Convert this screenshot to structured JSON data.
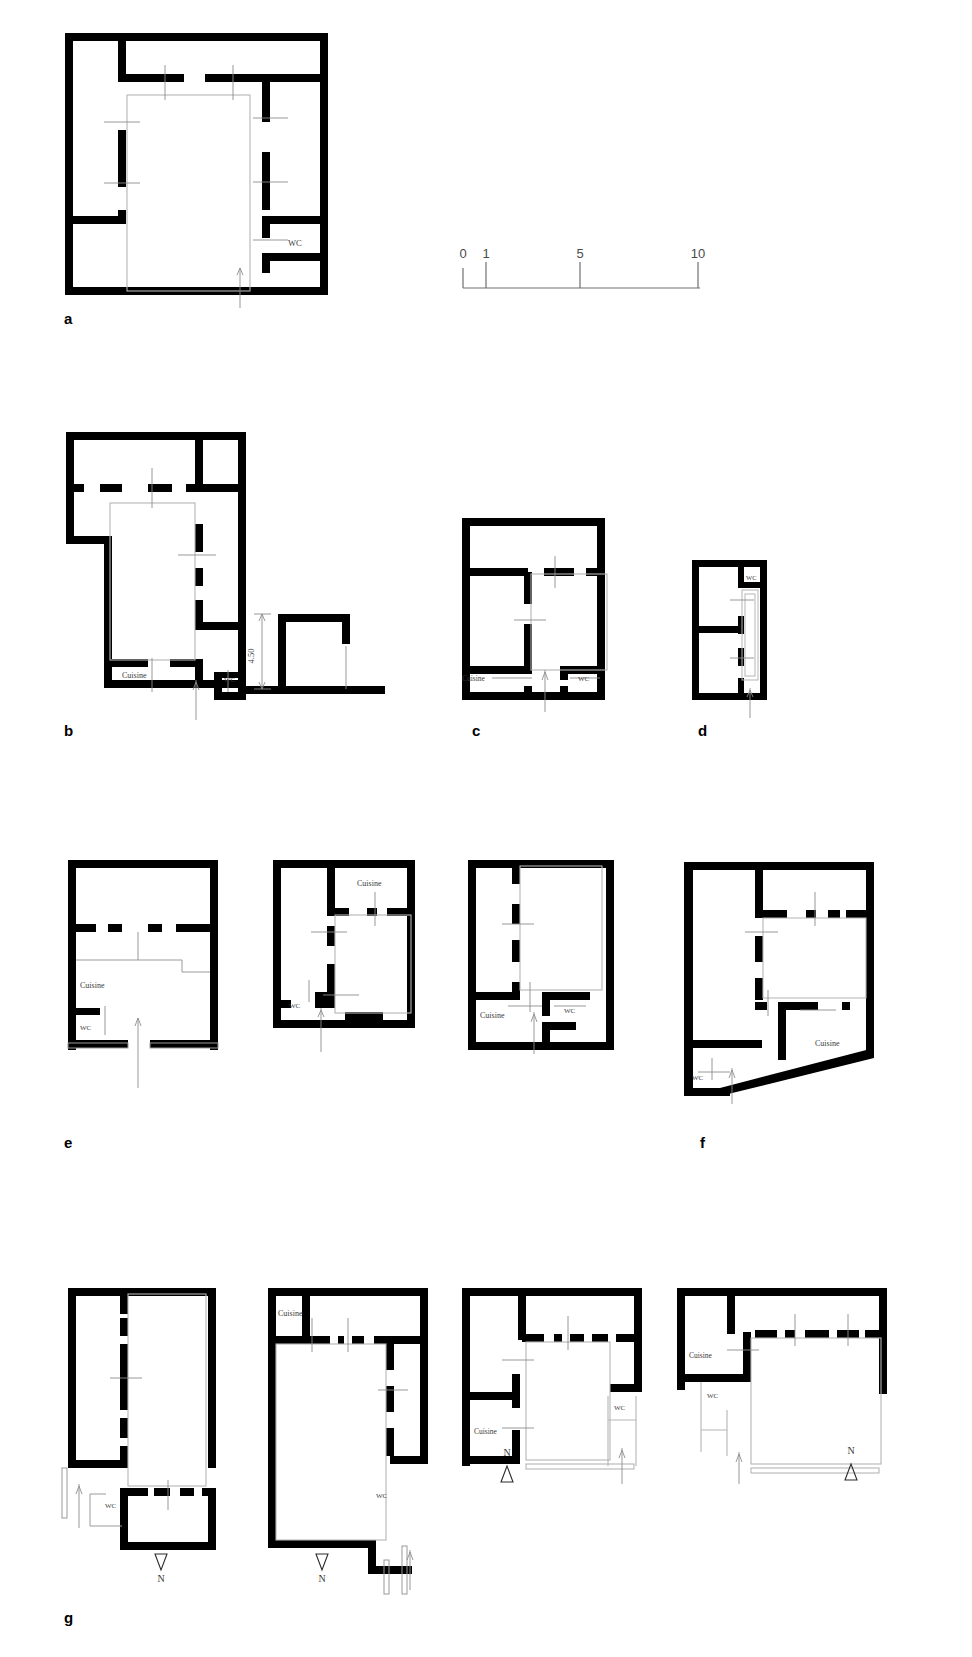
{
  "figure": {
    "type": "architectural-floor-plan-figure",
    "background_color": "#ffffff",
    "wall_color": "#000000",
    "thin_line_color": "#9a9a9a",
    "label_color": "#3a3a3a",
    "width": 972,
    "height": 1657
  },
  "panel_letters": [
    {
      "id": "a",
      "label": "a"
    },
    {
      "id": "b",
      "label": "b"
    },
    {
      "id": "c",
      "label": "c"
    },
    {
      "id": "d",
      "label": "d"
    },
    {
      "id": "e",
      "label": "e"
    },
    {
      "id": "f",
      "label": "f"
    },
    {
      "id": "g",
      "label": "g"
    }
  ],
  "scale_bar": {
    "name": "scale-bar",
    "unit_hint": "m",
    "ticks": [
      {
        "label": "0",
        "value": 0
      },
      {
        "label": "1",
        "value": 1
      },
      {
        "label": "5",
        "value": 5
      },
      {
        "label": "10",
        "value": 10
      }
    ]
  },
  "room_labels": {
    "kitchen": "Cuisine",
    "toilet": "WC",
    "north": "N",
    "dimension_450": "4.50"
  },
  "plans": [
    {
      "id": "a-1",
      "panel": "a",
      "labels": [
        {
          "text": "WC",
          "x": 290,
          "y": 243
        }
      ],
      "has_north_arrow": false
    },
    {
      "id": "b-1",
      "panel": "b",
      "labels": [
        {
          "text": "Cuisine",
          "x": 135,
          "y": 675
        },
        {
          "text": "WC",
          "x": 229,
          "y": 679
        }
      ],
      "has_north_arrow": true
    },
    {
      "id": "b-2-section",
      "panel": "b",
      "labels": [
        {
          "text": "4.50",
          "x": 253,
          "y": 638
        }
      ],
      "has_north_arrow": false
    },
    {
      "id": "c-1",
      "panel": "c",
      "labels": [
        {
          "text": "Cuisine",
          "x": 491,
          "y": 679
        },
        {
          "text": "WC",
          "x": 578,
          "y": 680
        }
      ],
      "has_north_arrow": true
    },
    {
      "id": "d-1",
      "panel": "d",
      "labels": [
        {
          "text": "WC",
          "x": 750,
          "y": 577
        }
      ],
      "has_north_arrow": true
    },
    {
      "id": "e-1",
      "panel": "e",
      "labels": [
        {
          "text": "Cuisine",
          "x": 95,
          "y": 1040
        },
        {
          "text": "WC",
          "x": 99,
          "y": 1098
        }
      ],
      "has_north_arrow": true
    },
    {
      "id": "e-2",
      "panel": "e",
      "labels": [
        {
          "text": "Cuisine",
          "x": 357,
          "y": 886
        },
        {
          "text": "WC",
          "x": 291,
          "y": 1014
        }
      ],
      "has_north_arrow": true
    },
    {
      "id": "e-3",
      "panel": "e",
      "labels": [
        {
          "text": "Cuisine",
          "x": 496,
          "y": 1018
        },
        {
          "text": "WC",
          "x": 580,
          "y": 1013
        }
      ],
      "has_north_arrow": true
    },
    {
      "id": "f-1",
      "panel": "f",
      "labels": [
        {
          "text": "Cuisine",
          "x": 824,
          "y": 1046
        },
        {
          "text": "WC",
          "x": 698,
          "y": 1076
        }
      ],
      "has_north_arrow": true
    },
    {
      "id": "g-1",
      "panel": "g",
      "labels": [
        {
          "text": "WC",
          "x": 108,
          "y": 1437
        },
        {
          "text": "N",
          "x": 162,
          "y": 1573
        }
      ],
      "north_arrow_direction": "down"
    },
    {
      "id": "g-2",
      "panel": "g",
      "labels": [
        {
          "text": "Cuisine",
          "x": 288,
          "y": 1312
        },
        {
          "text": "WC",
          "x": 381,
          "y": 1494
        },
        {
          "text": "N",
          "x": 322,
          "y": 1573
        }
      ],
      "north_arrow_direction": "down"
    },
    {
      "id": "g-3",
      "panel": "g",
      "labels": [
        {
          "text": "Cuisine",
          "x": 492,
          "y": 1414
        },
        {
          "text": "WC",
          "x": 641,
          "y": 1389
        },
        {
          "text": "N",
          "x": 507,
          "y": 1452
        }
      ],
      "north_arrow_direction": "up"
    },
    {
      "id": "g-4",
      "panel": "g",
      "labels": [
        {
          "text": "Cuisine",
          "x": 720,
          "y": 1362
        },
        {
          "text": "WC",
          "x": 731,
          "y": 1392
        },
        {
          "text": "N",
          "x": 851,
          "y": 1448
        }
      ],
      "north_arrow_direction": "up"
    }
  ]
}
